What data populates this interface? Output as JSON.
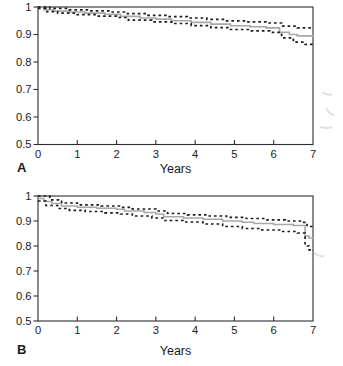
{
  "figure": {
    "type": "kaplan-meier-survival-figure",
    "background": "#ffffff"
  },
  "colors": {
    "axis": "#2e2e2e",
    "text": "#1a1a1a",
    "solid_line": "#a8a8a8",
    "dotted_line": "#1a1a1a",
    "artifact": "#c9c9c9"
  },
  "chart_data": [
    {
      "type": "line",
      "subtype": "kaplan-meier-survival-with-ci",
      "panel_label": "A",
      "xlabel": "Years",
      "ylabel": "",
      "xlim": [
        0,
        7
      ],
      "ylim": [
        0.5,
        1.0
      ],
      "x_ticks": [
        0,
        1,
        2,
        3,
        4,
        5,
        6,
        7
      ],
      "x_tick_labels": [
        "0",
        "1",
        "2",
        "3",
        "4",
        "5",
        "6",
        "7"
      ],
      "y_ticks": [
        1.0,
        0.9,
        0.8,
        0.7,
        0.6,
        0.5
      ],
      "y_tick_labels": [
        "1",
        "0.9",
        "0.8",
        "0.7",
        "0.6",
        "0.5"
      ],
      "grid": false,
      "legend": "none",
      "frame": true,
      "series": [
        {
          "name": "survival-estimate",
          "style": "solid",
          "color": "#a8a8a8",
          "points": [
            [
              0,
              1.0
            ],
            [
              0.15,
              0.99
            ],
            [
              0.4,
              0.985
            ],
            [
              0.8,
              0.982
            ],
            [
              1.2,
              0.978
            ],
            [
              1.7,
              0.974
            ],
            [
              2.1,
              0.966
            ],
            [
              2.6,
              0.96
            ],
            [
              3.0,
              0.956
            ],
            [
              3.4,
              0.95
            ],
            [
              3.9,
              0.944
            ],
            [
              4.4,
              0.938
            ],
            [
              4.9,
              0.932
            ],
            [
              5.4,
              0.928
            ],
            [
              5.8,
              0.924
            ],
            [
              6.15,
              0.908
            ],
            [
              6.4,
              0.9
            ],
            [
              6.6,
              0.895
            ],
            [
              7,
              0.893
            ]
          ]
        },
        {
          "name": "upper-confidence-limit",
          "style": "dotted",
          "color": "#1a1a1a",
          "points": [
            [
              0,
              1.0
            ],
            [
              0.3,
              0.995
            ],
            [
              0.8,
              0.99
            ],
            [
              1.3,
              0.986
            ],
            [
              1.8,
              0.982
            ],
            [
              2.2,
              0.976
            ],
            [
              2.8,
              0.97
            ],
            [
              3.3,
              0.965
            ],
            [
              3.8,
              0.96
            ],
            [
              4.3,
              0.955
            ],
            [
              4.8,
              0.95
            ],
            [
              5.3,
              0.946
            ],
            [
              5.8,
              0.942
            ],
            [
              6.2,
              0.93
            ],
            [
              6.6,
              0.924
            ],
            [
              7,
              0.922
            ]
          ]
        },
        {
          "name": "lower-confidence-limit",
          "style": "dotted",
          "color": "#1a1a1a",
          "points": [
            [
              0,
              0.995
            ],
            [
              0.2,
              0.983
            ],
            [
              0.5,
              0.978
            ],
            [
              1.0,
              0.972
            ],
            [
              1.5,
              0.967
            ],
            [
              2.0,
              0.962
            ],
            [
              2.3,
              0.952
            ],
            [
              2.9,
              0.946
            ],
            [
              3.4,
              0.94
            ],
            [
              3.9,
              0.932
            ],
            [
              4.4,
              0.925
            ],
            [
              4.9,
              0.918
            ],
            [
              5.4,
              0.913
            ],
            [
              5.9,
              0.908
            ],
            [
              6.2,
              0.888
            ],
            [
              6.5,
              0.872
            ],
            [
              6.8,
              0.864
            ],
            [
              7,
              0.862
            ]
          ]
        }
      ]
    },
    {
      "type": "line",
      "subtype": "kaplan-meier-survival-with-ci",
      "panel_label": "B",
      "xlabel": "Years",
      "ylabel": "",
      "xlim": [
        0,
        7
      ],
      "ylim": [
        0.5,
        1.0
      ],
      "x_ticks": [
        0,
        1,
        2,
        3,
        4,
        5,
        6,
        7
      ],
      "x_tick_labels": [
        "0",
        "1",
        "2",
        "3",
        "4",
        "5",
        "6",
        "7"
      ],
      "y_ticks": [
        1.0,
        0.9,
        0.8,
        0.7,
        0.6,
        0.5
      ],
      "y_tick_labels": [
        "1",
        "0.9",
        "0.8",
        "0.7",
        "0.6",
        "0.5"
      ],
      "grid": false,
      "legend": "none",
      "frame": true,
      "series": [
        {
          "name": "survival-estimate",
          "style": "solid",
          "color": "#a8a8a8",
          "points": [
            [
              0,
              0.99
            ],
            [
              0.15,
              0.978
            ],
            [
              0.35,
              0.97
            ],
            [
              0.6,
              0.96
            ],
            [
              1.0,
              0.955
            ],
            [
              1.5,
              0.951
            ],
            [
              2.0,
              0.947
            ],
            [
              2.2,
              0.94
            ],
            [
              2.7,
              0.934
            ],
            [
              3.0,
              0.928
            ],
            [
              3.2,
              0.917
            ],
            [
              3.7,
              0.912
            ],
            [
              4.2,
              0.907
            ],
            [
              4.7,
              0.9
            ],
            [
              5.2,
              0.895
            ],
            [
              5.5,
              0.89
            ],
            [
              6.0,
              0.886
            ],
            [
              6.5,
              0.882
            ],
            [
              6.8,
              0.84
            ],
            [
              6.9,
              0.832
            ],
            [
              7,
              0.828
            ]
          ]
        },
        {
          "name": "upper-confidence-limit",
          "style": "dotted",
          "color": "#1a1a1a",
          "points": [
            [
              0,
              1.0
            ],
            [
              0.3,
              0.985
            ],
            [
              0.6,
              0.972
            ],
            [
              1.0,
              0.965
            ],
            [
              1.6,
              0.96
            ],
            [
              2.1,
              0.955
            ],
            [
              2.4,
              0.948
            ],
            [
              3.0,
              0.94
            ],
            [
              3.3,
              0.93
            ],
            [
              3.8,
              0.925
            ],
            [
              4.3,
              0.92
            ],
            [
              4.8,
              0.915
            ],
            [
              5.3,
              0.91
            ],
            [
              5.8,
              0.905
            ],
            [
              6.3,
              0.9
            ],
            [
              6.7,
              0.895
            ],
            [
              6.85,
              0.878
            ],
            [
              7,
              0.875
            ]
          ]
        },
        {
          "name": "lower-confidence-limit",
          "style": "dotted",
          "color": "#1a1a1a",
          "points": [
            [
              0,
              0.98
            ],
            [
              0.2,
              0.962
            ],
            [
              0.5,
              0.95
            ],
            [
              0.8,
              0.943
            ],
            [
              1.2,
              0.938
            ],
            [
              1.7,
              0.933
            ],
            [
              2.1,
              0.928
            ],
            [
              2.4,
              0.92
            ],
            [
              2.9,
              0.912
            ],
            [
              3.2,
              0.902
            ],
            [
              3.7,
              0.896
            ],
            [
              4.2,
              0.888
            ],
            [
              4.7,
              0.878
            ],
            [
              5.2,
              0.87
            ],
            [
              5.7,
              0.864
            ],
            [
              6.2,
              0.858
            ],
            [
              6.6,
              0.852
            ],
            [
              6.8,
              0.8
            ],
            [
              6.9,
              0.785
            ],
            [
              7,
              0.78
            ]
          ]
        }
      ]
    }
  ]
}
